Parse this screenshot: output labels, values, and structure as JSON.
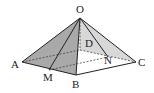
{
  "figure": {
    "type": "pyramid",
    "vertices": {
      "O": {
        "label": "O",
        "x": 80,
        "y": 18
      },
      "A": {
        "label": "A",
        "x": 22,
        "y": 62
      },
      "B": {
        "label": "B",
        "x": 76,
        "y": 75
      },
      "C": {
        "label": "C",
        "x": 136,
        "y": 62
      },
      "D": {
        "label": "D",
        "x": 80,
        "y": 50
      },
      "M": {
        "label": "M",
        "x": 49,
        "y": 70
      },
      "N": {
        "label": "N",
        "x": 108,
        "y": 57
      }
    },
    "colors": {
      "dark_face": "#a9a9a9",
      "light_face": "#d6d6d6",
      "edge": "#222222"
    }
  }
}
